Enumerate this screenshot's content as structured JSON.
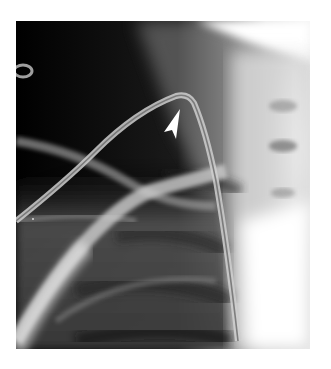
{
  "image": {
    "type": "chest radiograph",
    "view": "right upper chest / shoulder, frontal",
    "annotation": {
      "marker": "white arrowhead",
      "target": "apex of looped catheter"
    },
    "colors": {
      "background": "#ffffff",
      "air_dark": "#050505",
      "soft_tissue": "#6e6e6e",
      "bone_light": "#d8d8d8",
      "spine_light": "#ececec",
      "marker": "#ffffff"
    }
  }
}
